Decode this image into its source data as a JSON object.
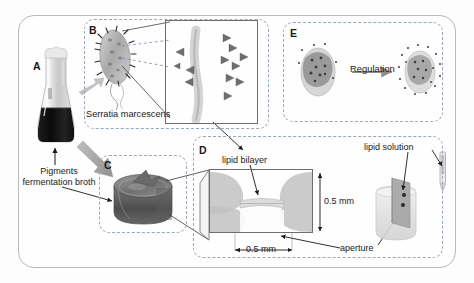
{
  "figure": {
    "background": "#fdfdfd",
    "frame_color": "#b9b9b9",
    "panel_border_color": "#9aa6c9"
  },
  "panels": [
    {
      "id": "A",
      "letter": "A",
      "name": "fermentation-flask"
    },
    {
      "id": "B",
      "letter": "B",
      "name": "bacterium"
    },
    {
      "id": "C",
      "letter": "C",
      "name": "pigment-dish"
    },
    {
      "id": "D",
      "letter": "D",
      "name": "lipid-bilayer-cross-section"
    },
    {
      "id": "E",
      "letter": "E",
      "name": "regulation"
    }
  ],
  "labels": {
    "species": "Serratia marcescens",
    "pigments_line1": "Pigments",
    "pigments_line2": "fermentation broth",
    "lipid_bilayer": "lipid bilayer",
    "lipid_solution": "lipid solution",
    "aperture": "aperture",
    "regulation": "Regulation",
    "dim_vertical": "0.5 mm",
    "dim_horizontal": "0.5 mm"
  },
  "icons": {
    "flask": "erlenmeyer-flask-icon",
    "bacterium": "rod-bacterium-icon",
    "dish": "petri-dish-icon",
    "membrane": "lipid-bilayer-icon",
    "pipette": "pipette-icon",
    "beaker": "beaker-icon",
    "arrow": "arrow-icon"
  },
  "colors": {
    "broth": "#141414",
    "flask_glass": "#cfcfcf",
    "bacterium_body": "#b7b7b7",
    "prodigiosin": "#6b6b6b",
    "membrane_gray": "#c9c9c9",
    "dish_gray": "#8f8f8f",
    "arrow_gray": "#8c8c8c"
  }
}
